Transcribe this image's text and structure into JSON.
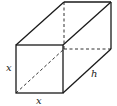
{
  "diagram": {
    "type": "rectangular-prism",
    "labels": {
      "front_height": "x",
      "front_width": "x",
      "depth": "h"
    },
    "colors": {
      "stroke": "#1a1a1a",
      "background": "#ffffff"
    }
  }
}
